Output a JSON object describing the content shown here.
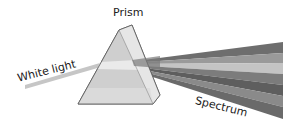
{
  "labels": {
    "prism": "Prism",
    "white_light": "White light",
    "spectrum": "Spectrum"
  },
  "colors": {
    "background": "#ffffff",
    "beam": "#c8c8c8",
    "prism_light": "#e2e2e2",
    "prism_mid": "#cfcfcf",
    "prism_dark": "#b0b0b0",
    "spectrum_bands": [
      "#6e6e6e",
      "#9a9a9a",
      "#c4c4c4",
      "#7c7c7c",
      "#5e5e5e",
      "#8a8a8a",
      "#6a6a6a"
    ]
  }
}
